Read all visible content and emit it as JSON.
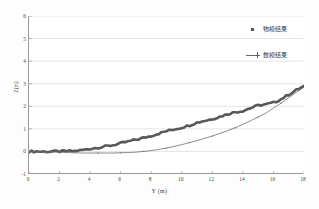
{
  "chart_data": {
    "type": "line",
    "title": "",
    "xlabel": "Y (m)",
    "ylabel": "Z(m)",
    "xlim": [
      0,
      18
    ],
    "ylim": [
      -1,
      6
    ],
    "xticks": [
      "0",
      "2",
      "4",
      "6",
      "8",
      "10",
      "12",
      "14",
      "16",
      "18"
    ],
    "yticks": [
      "6",
      "5",
      "4",
      "3",
      "2",
      "1",
      "0",
      "-1"
    ],
    "grid": "horizontal",
    "legend_position": "top-right",
    "series": [
      {
        "name": "物模结果",
        "marker": "square",
        "style": "thick-jagged",
        "color": "#595959",
        "x": [
          0,
          0.5,
          1,
          1.5,
          2,
          2.5,
          3,
          3.5,
          4,
          4.5,
          5,
          5.5,
          6,
          6.5,
          7,
          7.5,
          8,
          8.5,
          9,
          9.5,
          10,
          10.5,
          11,
          11.5,
          12,
          12.5,
          13,
          13.5,
          14,
          14.5,
          15,
          15.5,
          16,
          16.5,
          17,
          17.5,
          18
        ],
        "y": [
          0.0,
          0.0,
          -0.01,
          0.0,
          0.0,
          0.01,
          0.02,
          0.06,
          0.12,
          0.17,
          0.22,
          0.28,
          0.36,
          0.44,
          0.52,
          0.6,
          0.69,
          0.8,
          0.9,
          0.98,
          1.06,
          1.16,
          1.28,
          1.36,
          1.44,
          1.54,
          1.66,
          1.74,
          1.8,
          1.92,
          2.04,
          2.08,
          2.16,
          2.32,
          2.52,
          2.72,
          2.9
        ]
      },
      {
        "name": "数模结果",
        "marker": "plus",
        "style": "thin-smooth",
        "color": "#6d6d6d",
        "x": [
          0,
          0.5,
          1,
          1.5,
          2,
          2.5,
          3,
          3.5,
          4,
          4.5,
          5,
          5.5,
          6,
          6.5,
          7,
          7.5,
          8,
          8.5,
          9,
          9.5,
          10,
          10.5,
          11,
          11.5,
          12,
          12.5,
          13,
          13.5,
          14,
          14.5,
          15,
          15.5,
          16,
          16.5,
          17,
          17.5,
          18
        ],
        "y": [
          -0.02,
          -0.02,
          -0.03,
          -0.03,
          -0.04,
          -0.05,
          -0.06,
          -0.07,
          -0.07,
          -0.07,
          -0.07,
          -0.07,
          -0.06,
          -0.05,
          -0.03,
          0.0,
          0.04,
          0.09,
          0.15,
          0.22,
          0.3,
          0.39,
          0.48,
          0.58,
          0.68,
          0.8,
          0.92,
          1.05,
          1.2,
          1.36,
          1.52,
          1.7,
          1.92,
          2.14,
          2.38,
          2.62,
          2.84
        ]
      }
    ]
  },
  "legend": {
    "entries": [
      {
        "label": "物模结果"
      },
      {
        "label": "数模结果"
      }
    ]
  }
}
